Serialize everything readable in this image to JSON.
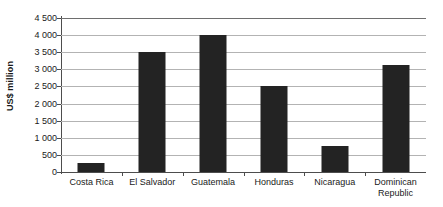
{
  "chart_data": {
    "type": "bar",
    "title": "",
    "subtitle": "",
    "xlabel": "",
    "ylabel": "US$ million",
    "categories": [
      "Costa Rica",
      "El Salvador",
      "Guatemala",
      "Honduras",
      "Nicaragua",
      "Dominican Republic"
    ],
    "values": [
      250,
      3500,
      4000,
      2500,
      750,
      3130
    ],
    "ylim": [
      0,
      4500
    ],
    "ytick_step": 500,
    "ytick_labels": [
      "0",
      "500",
      "1 000",
      "1 500",
      "2 000",
      "2 500",
      "3 000",
      "3 500",
      "4 000",
      "4 500"
    ],
    "ytick_values": [
      0,
      500,
      1000,
      1500,
      2000,
      2500,
      3000,
      3500,
      4000,
      4500
    ],
    "grid": true,
    "legend": false,
    "legend_position": "none",
    "series": [
      {
        "name": "US$ million",
        "values": [
          250,
          3500,
          4000,
          2500,
          750,
          3130
        ]
      }
    ],
    "colors": {
      "bar": "#232323",
      "gridline": "#b3b3b3",
      "axis": "#4d4d4d",
      "background": "#ffffff",
      "text": "#1a1a1a"
    }
  }
}
